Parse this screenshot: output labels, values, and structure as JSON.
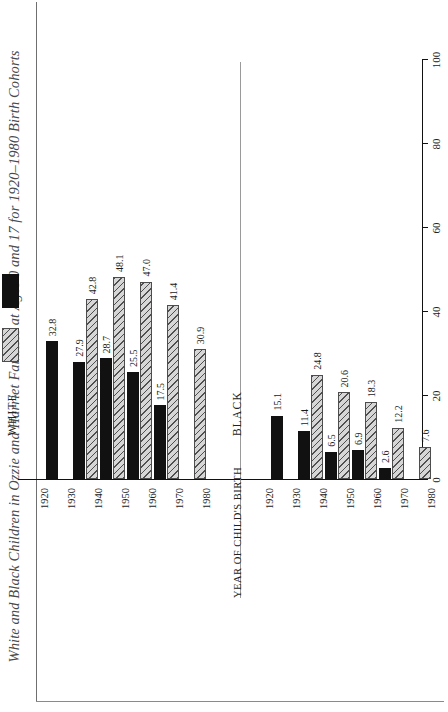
{
  "figure": {
    "title": "White and Black Children in Ozzie and Harriet Families at Ages 0 and 17 for 1920–1980 Birth Cohorts",
    "group_white_label": "WHITE",
    "group_black_label": "BLACK"
  },
  "legend": {
    "age0_label": "Age 0",
    "age17_label": "Age 17"
  },
  "axis": {
    "value_title": "PERCENT",
    "category_title": "YEAR OF CHILD'S BIRTH",
    "value_ticks": [
      "0",
      "20",
      "40",
      "60",
      "80",
      "100"
    ]
  },
  "colors": {
    "age0_hatch_line": "#4f4f4f",
    "age0_hatch_fill": "#d6d6d6",
    "age17_fill": "#111111",
    "axis": "#111111",
    "text": "#1a1a1a"
  },
  "chart_data": {
    "type": "bar",
    "title": "White and Black Children in Ozzie and Harriet Families at Ages 0 and 17 for 1920–1980 Birth Cohorts",
    "xlabel": "YEAR OF CHILD'S BIRTH",
    "ylabel": "PERCENT",
    "ylim": [
      0,
      100
    ],
    "yticks": [
      0,
      20,
      40,
      60,
      80,
      100
    ],
    "grid": false,
    "orientation": "rotated-90-horizontal-bars",
    "legend_position": "upper-left-within-white-panel",
    "groups": [
      {
        "name": "WHITE",
        "categories": [
          "1920",
          "1930",
          "1940",
          "1950",
          "1960",
          "1970",
          "1980"
        ],
        "series": [
          {
            "name": "Age 0",
            "values": [
              null,
              null,
              42.8,
              48.1,
              47.0,
              41.4,
              30.9
            ]
          },
          {
            "name": "Age 17",
            "values": [
              32.8,
              27.9,
              28.7,
              25.5,
              17.5,
              null,
              null
            ]
          }
        ]
      },
      {
        "name": "BLACK",
        "categories": [
          "1920",
          "1930",
          "1940",
          "1950",
          "1960",
          "1970",
          "1980"
        ],
        "series": [
          {
            "name": "Age 0",
            "values": [
              null,
              null,
              24.8,
              20.6,
              18.3,
              12.2,
              7.6
            ]
          },
          {
            "name": "Age 17",
            "values": [
              15.1,
              11.4,
              6.5,
              6.9,
              2.6,
              null,
              null
            ]
          }
        ]
      }
    ]
  }
}
